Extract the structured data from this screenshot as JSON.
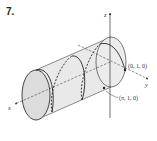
{
  "problem_number": "7.",
  "axes": {
    "x": "x",
    "y": "y",
    "z": "z"
  },
  "points": [
    {
      "label": "(0, 1, 0)"
    },
    {
      "label": "(π, 1, 0)"
    }
  ],
  "figure": {
    "cylinder_fill": "#e8e8e8",
    "stroke_color": "#333333"
  }
}
